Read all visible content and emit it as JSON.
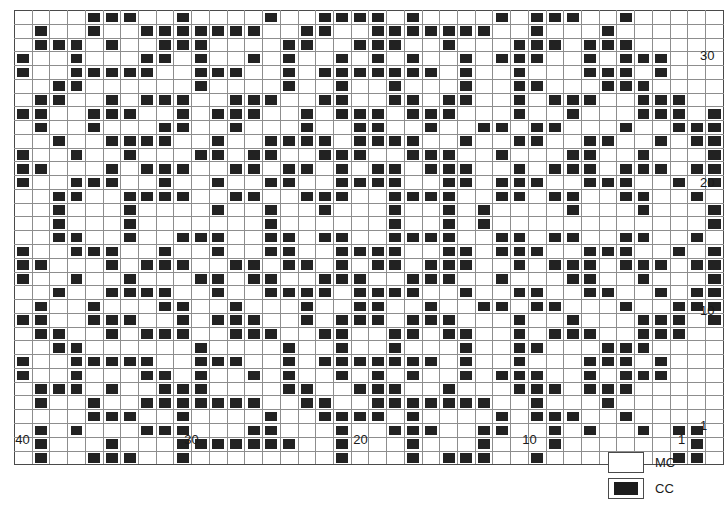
{
  "title": "",
  "chart_data": {
    "type": "heatmap",
    "title": "",
    "xlabel": "",
    "ylabel": "",
    "subtitle": "Two-colour stranded knitting colourwork chart",
    "grid": true,
    "legend_position": "bottom-right",
    "columns": 40,
    "rows": 33,
    "x_tick_labels": [
      "40",
      "30",
      "20",
      "10",
      "1"
    ],
    "x_tick_values": [
      40,
      30,
      20,
      10,
      1
    ],
    "x_direction": "right-to-left",
    "y_tick_labels": [
      "30",
      "20",
      "10",
      "1"
    ],
    "y_tick_values": [
      30,
      20,
      10,
      1
    ],
    "y_direction": "bottom-to-top",
    "major_gridline_interval": 5,
    "value_legend": {
      "0": "MC",
      "1": "CC"
    },
    "colors": {
      "MC": "#ffffff",
      "CC": "#222222",
      "gridline": "#8d8d8d",
      "major_gridline": "#4a4a4a"
    },
    "matrix": [
      [
        0,
        0,
        0,
        0,
        1,
        1,
        1,
        0,
        0,
        1,
        0,
        0,
        0,
        0,
        1,
        0,
        0,
        1,
        1,
        1,
        1,
        0,
        1,
        0,
        0,
        0,
        0,
        1,
        0,
        1,
        1,
        1,
        0,
        0,
        1,
        0,
        0,
        0,
        0,
        0
      ],
      [
        0,
        1,
        0,
        0,
        1,
        0,
        0,
        1,
        1,
        1,
        1,
        1,
        1,
        1,
        0,
        0,
        1,
        1,
        0,
        0,
        1,
        1,
        1,
        1,
        1,
        1,
        1,
        0,
        0,
        1,
        0,
        0,
        0,
        1,
        0,
        0,
        0,
        0,
        0,
        0
      ],
      [
        0,
        1,
        1,
        1,
        0,
        1,
        0,
        0,
        1,
        1,
        1,
        0,
        0,
        0,
        0,
        1,
        1,
        0,
        0,
        1,
        1,
        1,
        0,
        0,
        1,
        0,
        0,
        0,
        1,
        1,
        1,
        0,
        1,
        1,
        1,
        0,
        0,
        0,
        0,
        0
      ],
      [
        1,
        0,
        0,
        1,
        0,
        0,
        0,
        1,
        1,
        0,
        1,
        0,
        0,
        1,
        0,
        1,
        0,
        0,
        1,
        0,
        1,
        0,
        1,
        0,
        0,
        1,
        0,
        1,
        1,
        1,
        0,
        0,
        1,
        0,
        1,
        1,
        1,
        0,
        0,
        0
      ],
      [
        1,
        0,
        0,
        1,
        1,
        1,
        1,
        1,
        0,
        0,
        1,
        1,
        1,
        0,
        0,
        1,
        0,
        1,
        1,
        1,
        1,
        1,
        1,
        1,
        0,
        1,
        0,
        0,
        1,
        0,
        0,
        0,
        1,
        1,
        1,
        0,
        1,
        0,
        0,
        0
      ],
      [
        0,
        0,
        1,
        1,
        0,
        0,
        0,
        0,
        0,
        0,
        1,
        0,
        0,
        0,
        0,
        1,
        0,
        0,
        1,
        0,
        0,
        1,
        0,
        0,
        0,
        1,
        0,
        0,
        1,
        1,
        0,
        0,
        0,
        1,
        1,
        1,
        0,
        0,
        0,
        0
      ],
      [
        0,
        1,
        1,
        0,
        0,
        1,
        0,
        1,
        1,
        1,
        0,
        0,
        1,
        1,
        1,
        0,
        0,
        1,
        1,
        0,
        0,
        1,
        1,
        0,
        1,
        1,
        0,
        0,
        1,
        0,
        1,
        1,
        1,
        0,
        0,
        1,
        1,
        1,
        0,
        0
      ],
      [
        1,
        1,
        0,
        0,
        1,
        1,
        1,
        0,
        0,
        1,
        0,
        1,
        1,
        1,
        0,
        0,
        1,
        0,
        1,
        1,
        1,
        0,
        1,
        1,
        1,
        0,
        0,
        0,
        1,
        0,
        0,
        1,
        0,
        0,
        0,
        1,
        1,
        1,
        0,
        1
      ],
      [
        0,
        1,
        0,
        0,
        1,
        0,
        0,
        0,
        1,
        1,
        0,
        0,
        1,
        0,
        0,
        0,
        1,
        0,
        0,
        1,
        1,
        0,
        0,
        1,
        0,
        0,
        1,
        1,
        0,
        1,
        1,
        0,
        0,
        0,
        1,
        0,
        0,
        1,
        1,
        1
      ],
      [
        0,
        0,
        1,
        0,
        0,
        1,
        1,
        1,
        1,
        0,
        0,
        1,
        0,
        0,
        1,
        1,
        1,
        1,
        0,
        1,
        1,
        1,
        1,
        0,
        0,
        1,
        0,
        0,
        1,
        1,
        0,
        0,
        1,
        1,
        0,
        0,
        1,
        0,
        1,
        1
      ],
      [
        1,
        0,
        0,
        1,
        0,
        0,
        1,
        0,
        0,
        0,
        1,
        1,
        0,
        1,
        1,
        0,
        0,
        1,
        1,
        1,
        0,
        0,
        1,
        1,
        1,
        0,
        0,
        1,
        0,
        0,
        0,
        1,
        1,
        0,
        0,
        1,
        0,
        0,
        0,
        1
      ],
      [
        1,
        1,
        0,
        0,
        0,
        1,
        0,
        1,
        1,
        1,
        0,
        0,
        1,
        1,
        0,
        1,
        1,
        0,
        1,
        0,
        1,
        1,
        0,
        1,
        1,
        1,
        0,
        0,
        1,
        0,
        1,
        1,
        1,
        0,
        1,
        1,
        1,
        0,
        1,
        1
      ],
      [
        1,
        0,
        0,
        1,
        1,
        1,
        0,
        0,
        1,
        0,
        0,
        1,
        0,
        0,
        1,
        1,
        0,
        0,
        1,
        1,
        1,
        1,
        0,
        0,
        1,
        1,
        0,
        1,
        1,
        1,
        0,
        0,
        1,
        1,
        1,
        0,
        0,
        1,
        0,
        1
      ],
      [
        0,
        0,
        1,
        1,
        0,
        0,
        1,
        1,
        1,
        1,
        0,
        0,
        1,
        1,
        0,
        0,
        1,
        1,
        1,
        0,
        0,
        1,
        1,
        1,
        1,
        0,
        0,
        1,
        1,
        0,
        1,
        1,
        0,
        0,
        1,
        1,
        0,
        0,
        1,
        0
      ],
      [
        0,
        0,
        1,
        0,
        0,
        0,
        1,
        0,
        0,
        0,
        0,
        1,
        0,
        0,
        1,
        0,
        0,
        1,
        0,
        0,
        0,
        1,
        0,
        0,
        1,
        0,
        1,
        0,
        0,
        0,
        0,
        1,
        0,
        0,
        0,
        1,
        0,
        0,
        0,
        1
      ],
      [
        0,
        0,
        1,
        0,
        0,
        0,
        1,
        0,
        0,
        0,
        0,
        0,
        0,
        0,
        1,
        0,
        0,
        0,
        0,
        0,
        0,
        1,
        0,
        0,
        1,
        0,
        1,
        0,
        0,
        0,
        0,
        0,
        0,
        0,
        0,
        0,
        0,
        0,
        0,
        1
      ],
      [
        0,
        0,
        1,
        1,
        0,
        0,
        1,
        0,
        0,
        1,
        1,
        1,
        0,
        0,
        1,
        1,
        0,
        1,
        1,
        0,
        0,
        1,
        1,
        1,
        1,
        0,
        0,
        1,
        1,
        0,
        1,
        1,
        0,
        0,
        1,
        1,
        0,
        0,
        1,
        0
      ],
      [
        1,
        0,
        0,
        1,
        1,
        1,
        0,
        0,
        1,
        0,
        0,
        1,
        0,
        0,
        1,
        1,
        0,
        0,
        1,
        1,
        1,
        1,
        0,
        0,
        1,
        1,
        0,
        1,
        1,
        1,
        0,
        0,
        1,
        1,
        1,
        0,
        0,
        1,
        0,
        1
      ],
      [
        1,
        1,
        0,
        0,
        0,
        1,
        0,
        1,
        1,
        1,
        0,
        0,
        1,
        1,
        0,
        1,
        1,
        0,
        1,
        0,
        1,
        1,
        0,
        1,
        1,
        1,
        0,
        0,
        1,
        0,
        1,
        1,
        1,
        0,
        1,
        1,
        1,
        0,
        1,
        1
      ],
      [
        1,
        0,
        0,
        1,
        0,
        0,
        1,
        0,
        0,
        0,
        1,
        1,
        0,
        1,
        1,
        0,
        0,
        1,
        1,
        1,
        0,
        0,
        1,
        1,
        1,
        0,
        0,
        1,
        0,
        0,
        0,
        1,
        1,
        0,
        0,
        1,
        0,
        0,
        0,
        1
      ],
      [
        0,
        0,
        1,
        0,
        0,
        1,
        1,
        1,
        1,
        0,
        0,
        1,
        0,
        0,
        1,
        1,
        1,
        1,
        0,
        1,
        1,
        1,
        1,
        0,
        0,
        1,
        0,
        0,
        1,
        1,
        0,
        0,
        1,
        1,
        0,
        0,
        1,
        0,
        1,
        1
      ],
      [
        0,
        1,
        0,
        0,
        1,
        0,
        0,
        0,
        1,
        1,
        0,
        0,
        1,
        0,
        0,
        0,
        1,
        0,
        0,
        1,
        1,
        0,
        0,
        1,
        0,
        0,
        1,
        1,
        0,
        1,
        1,
        0,
        0,
        0,
        1,
        0,
        0,
        1,
        1,
        1
      ],
      [
        1,
        1,
        0,
        0,
        1,
        1,
        1,
        0,
        0,
        1,
        0,
        1,
        1,
        1,
        0,
        0,
        1,
        0,
        1,
        1,
        1,
        0,
        1,
        1,
        1,
        0,
        0,
        0,
        1,
        0,
        0,
        1,
        0,
        0,
        0,
        1,
        1,
        1,
        0,
        1
      ],
      [
        0,
        1,
        1,
        0,
        0,
        1,
        0,
        1,
        1,
        1,
        0,
        0,
        1,
        1,
        1,
        0,
        0,
        1,
        1,
        0,
        0,
        1,
        1,
        0,
        1,
        1,
        0,
        0,
        1,
        0,
        1,
        1,
        1,
        0,
        0,
        1,
        1,
        1,
        0,
        0
      ],
      [
        0,
        0,
        1,
        1,
        0,
        0,
        0,
        0,
        0,
        0,
        1,
        0,
        0,
        0,
        0,
        1,
        0,
        0,
        1,
        0,
        0,
        1,
        0,
        0,
        0,
        1,
        0,
        0,
        1,
        1,
        0,
        0,
        0,
        1,
        1,
        1,
        0,
        0,
        0,
        0
      ],
      [
        1,
        0,
        0,
        1,
        1,
        1,
        1,
        1,
        0,
        0,
        1,
        1,
        1,
        0,
        0,
        1,
        0,
        1,
        1,
        1,
        1,
        1,
        1,
        1,
        0,
        1,
        0,
        0,
        1,
        0,
        0,
        0,
        1,
        1,
        1,
        0,
        1,
        0,
        0,
        0
      ],
      [
        1,
        0,
        0,
        1,
        0,
        0,
        0,
        1,
        1,
        0,
        1,
        0,
        0,
        1,
        0,
        1,
        0,
        0,
        1,
        0,
        1,
        0,
        1,
        0,
        0,
        1,
        0,
        1,
        1,
        1,
        0,
        0,
        1,
        0,
        1,
        1,
        1,
        0,
        0,
        0
      ],
      [
        0,
        1,
        1,
        1,
        0,
        1,
        0,
        0,
        1,
        1,
        1,
        0,
        0,
        0,
        0,
        1,
        1,
        0,
        0,
        1,
        1,
        1,
        0,
        0,
        1,
        0,
        0,
        0,
        1,
        1,
        1,
        0,
        1,
        1,
        1,
        0,
        0,
        0,
        0,
        0
      ],
      [
        0,
        1,
        0,
        0,
        1,
        0,
        0,
        1,
        1,
        1,
        1,
        1,
        1,
        1,
        0,
        0,
        1,
        1,
        0,
        0,
        1,
        1,
        1,
        1,
        1,
        1,
        1,
        0,
        0,
        1,
        0,
        0,
        0,
        1,
        0,
        0,
        0,
        0,
        0,
        0
      ],
      [
        0,
        0,
        0,
        0,
        1,
        1,
        1,
        0,
        0,
        1,
        0,
        0,
        0,
        0,
        1,
        0,
        0,
        1,
        1,
        1,
        1,
        0,
        1,
        0,
        0,
        0,
        0,
        1,
        0,
        1,
        1,
        1,
        0,
        0,
        1,
        0,
        0,
        0,
        0,
        0
      ],
      [
        0,
        1,
        0,
        1,
        0,
        0,
        0,
        1,
        1,
        1,
        0,
        0,
        0,
        1,
        1,
        0,
        0,
        0,
        1,
        0,
        0,
        1,
        1,
        1,
        0,
        0,
        1,
        1,
        0,
        0,
        1,
        0,
        1,
        0,
        0,
        1,
        0,
        1,
        1,
        0
      ],
      [
        0,
        1,
        0,
        0,
        0,
        1,
        0,
        0,
        0,
        1,
        1,
        1,
        1,
        1,
        1,
        1,
        0,
        0,
        1,
        0,
        0,
        0,
        1,
        0,
        0,
        0,
        1,
        0,
        0,
        0,
        1,
        0,
        0,
        0,
        0,
        0,
        0,
        0,
        1,
        0
      ],
      [
        0,
        1,
        0,
        0,
        1,
        1,
        1,
        0,
        0,
        1,
        0,
        0,
        0,
        0,
        0,
        0,
        0,
        0,
        1,
        0,
        0,
        0,
        1,
        0,
        1,
        1,
        1,
        0,
        0,
        1,
        0,
        0,
        0,
        0,
        0,
        0,
        0,
        1,
        1,
        0
      ]
    ]
  },
  "legend": {
    "items": [
      {
        "key": "MC",
        "label": "MC",
        "swatch": "white"
      },
      {
        "key": "CC",
        "label": "CC",
        "swatch": "black"
      }
    ]
  }
}
